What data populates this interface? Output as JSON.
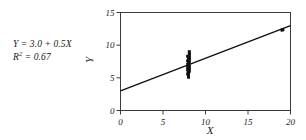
{
  "figure": {
    "background_color": "#ffffff",
    "foreground_color": "#1a1a1a"
  },
  "annotation": {
    "equation_prefix": "Y",
    "equation": "Y = 3.0 + 0.5X",
    "equation_lhs": "Y",
    "equation_rhs": "= 3.0 + 0.5X",
    "r_squared_symbol": "R",
    "r_squared_exponent": "2",
    "r_squared_value": "= 0.67",
    "r_squared_full": "R2 = 0.67"
  },
  "chart_data": {
    "type": "scatter",
    "title": "",
    "subtitle": "",
    "xlabel": "X",
    "ylabel": "Y",
    "xlim": [
      0,
      20
    ],
    "ylim": [
      0,
      15
    ],
    "xticks": [
      0,
      5,
      10,
      15,
      20
    ],
    "yticks": [
      0,
      5,
      10,
      15
    ],
    "xtick_labels": [
      "0",
      "5",
      "10",
      "15",
      "20"
    ],
    "ytick_labels": [
      "0",
      "5",
      "10",
      "15"
    ],
    "grid": false,
    "legend": null,
    "legend_position": "none",
    "frame": "box",
    "tick_direction": "out",
    "marker_color": "#111111",
    "marker_shape": "square",
    "marker_size": 3,
    "series": [
      {
        "name": "observations",
        "type": "scatter",
        "points": [
          [
            8.0,
            5.1
          ],
          [
            8.0,
            5.4
          ],
          [
            8.0,
            5.7
          ],
          [
            8.0,
            5.9
          ],
          [
            8.0,
            6.1
          ],
          [
            8.0,
            6.3
          ],
          [
            8.0,
            6.5
          ],
          [
            8.0,
            6.7
          ],
          [
            8.0,
            6.9
          ],
          [
            8.0,
            7.0
          ],
          [
            8.0,
            7.1
          ],
          [
            8.0,
            7.2
          ],
          [
            8.0,
            7.3
          ],
          [
            8.0,
            7.5
          ],
          [
            8.0,
            7.7
          ],
          [
            8.0,
            7.9
          ],
          [
            8.1,
            8.1
          ],
          [
            8.1,
            8.4
          ],
          [
            8.1,
            8.7
          ],
          [
            8.1,
            9.0
          ],
          [
            8.1,
            6.0
          ],
          [
            8.1,
            6.4
          ],
          [
            8.1,
            6.8
          ],
          [
            8.1,
            7.4
          ],
          [
            8.1,
            7.8
          ],
          [
            7.9,
            5.6
          ],
          [
            7.9,
            6.2
          ],
          [
            7.9,
            6.6
          ],
          [
            7.9,
            7.05
          ],
          [
            7.9,
            7.6
          ],
          [
            7.9,
            8.3
          ],
          [
            19.0,
            12.3
          ],
          [
            19.1,
            12.4
          ]
        ]
      },
      {
        "name": "regression-line",
        "type": "line",
        "color": "#111111",
        "intercept": 3.0,
        "slope": 0.5,
        "x_start": 0,
        "y_start": 3.0,
        "x_end": 20,
        "y_end": 13.0
      }
    ]
  }
}
